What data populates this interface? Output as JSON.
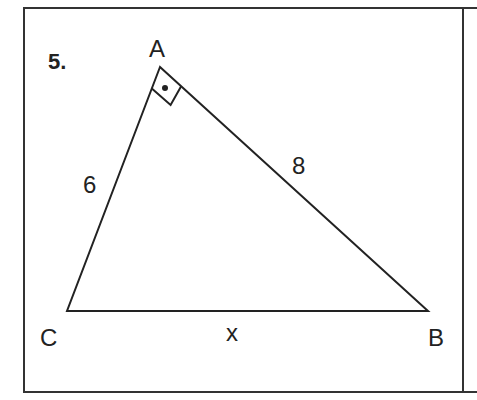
{
  "problem": {
    "number": "5.",
    "vertices": {
      "A": {
        "label": "A"
      },
      "B": {
        "label": "B"
      },
      "C": {
        "label": "C"
      }
    },
    "sides": {
      "AC": "6",
      "AB": "8",
      "CB": "x"
    },
    "right_angle_at": "A",
    "right_angle_marker": "square-with-dot"
  },
  "colors": {
    "stroke": "#222222",
    "background": "#ffffff"
  }
}
